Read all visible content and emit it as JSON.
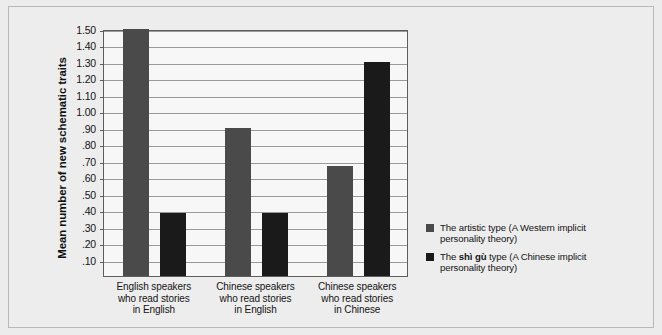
{
  "chart_data": {
    "type": "bar",
    "title": "",
    "xlabel": "",
    "ylabel": "Mean number of new schematic traits",
    "ylim": [
      0,
      1.5
    ],
    "ytick_step": 0.1,
    "ytick_labels": [
      "1.50",
      "1.40",
      "1.30",
      "1.20",
      "1.10",
      "1.00",
      ".90",
      ".80",
      ".70",
      ".60",
      ".50",
      ".40",
      ".30",
      ".20",
      ".10"
    ],
    "ytick_values": [
      1.5,
      1.4,
      1.3,
      1.2,
      1.1,
      1.0,
      0.9,
      0.8,
      0.7,
      0.6,
      0.5,
      0.4,
      0.3,
      0.2,
      0.1
    ],
    "grid": true,
    "legend_position": "right",
    "categories": [
      "English speakers\nwho read stories\nin English",
      "Chinese speakers\nwho read stories\nin English",
      "Chinese speakers\nwho read stories\nin Chinese"
    ],
    "series": [
      {
        "name": "The artistic type (A Western implicit personality theory)",
        "color": "#4a4a4a",
        "values": [
          1.5,
          0.9,
          0.67
        ]
      },
      {
        "name": "The shì gù type (A Chinese implicit personality theory)",
        "color": "#1a1a1a",
        "values": [
          0.38,
          0.38,
          1.3
        ]
      }
    ]
  },
  "legend": {
    "items": [
      {
        "prefix": "The artistic type (A Western implicit",
        "emphasis": "",
        "suffix": "",
        "line2": "personality theory)",
        "color": "#4a4a4a"
      },
      {
        "prefix": "The ",
        "emphasis": "shì gù",
        "suffix": " type (A Chinese implicit",
        "line2": "personality theory)",
        "color": "#1a1a1a"
      }
    ]
  },
  "axes": {
    "y_title": "Mean number of new schematic traits",
    "x_categories": [
      [
        "English speakers",
        "who read stories",
        "in English"
      ],
      [
        "Chinese speakers",
        "who read stories",
        "in English"
      ],
      [
        "Chinese speakers",
        "who read stories",
        "in Chinese"
      ]
    ]
  },
  "colors": {
    "figure_background": "#ececec",
    "plot_background": "#f7f7f7",
    "gridline": "#9a9a9a",
    "axis": "#5d5d5d",
    "series_1": "#4a4a4a",
    "series_2": "#1a1a1a",
    "text": "#141414"
  }
}
